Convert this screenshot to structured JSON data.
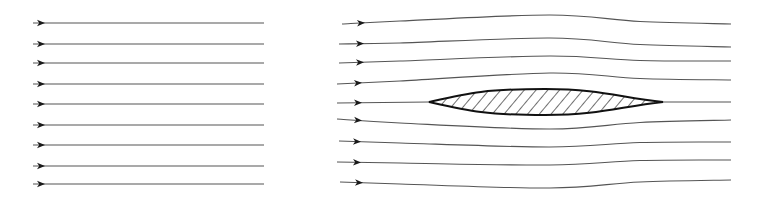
{
  "diagram": {
    "colors": {
      "background": "#ffffff",
      "streamline": "#555555",
      "arrowhead": "#1a1a1a",
      "airfoil_stroke": "#111111",
      "hatch": "#222222"
    },
    "left_panel": {
      "description": "Uniform undisturbed flow: 9 parallel horizontal streamlines",
      "arrow_x": 42,
      "x_start": 33,
      "x_end": 264,
      "streamlines_y": [
        23,
        44,
        63,
        84,
        104,
        125,
        145,
        166,
        184
      ]
    },
    "right_panel": {
      "description": "Flow around a streamlined airfoil body (hatched, symmetric lens shape); streamlines deflect around the body",
      "airfoil": {
        "leading_edge": [
          429,
          102
        ],
        "trailing_edge": [
          663,
          102
        ],
        "top_max_y": 89,
        "bottom_max_y": 115,
        "max_thickness_x": 545,
        "hatch": "diagonal",
        "hatch_spacing": 9
      },
      "streamlines": [
        {
          "start": [
            342,
            24
          ],
          "arrow_x": 362,
          "mid": [
            [
              400,
              21
            ],
            [
              550,
              15
            ]
          ],
          "end": [
            731,
            24
          ]
        },
        {
          "start": [
            339,
            44
          ],
          "arrow_x": 361,
          "mid": [
            [
              400,
              43
            ],
            [
              550,
              38
            ]
          ],
          "end": [
            731,
            47
          ]
        },
        {
          "start": [
            339,
            63
          ],
          "arrow_x": 361,
          "mid": [
            [
              400,
              61
            ],
            [
              550,
              56
            ]
          ],
          "end": [
            731,
            61
          ]
        },
        {
          "start": [
            337,
            84
          ],
          "arrow_x": 359,
          "mid": [
            [
              400,
              81
            ],
            [
              550,
              73
            ]
          ],
          "end": [
            731,
            80
          ]
        },
        {
          "start": [
            337,
            103
          ],
          "arrow_x": 359,
          "mid": [
            [
              429,
              102
            ],
            [
              663,
              102
            ]
          ],
          "end": [
            731,
            102
          ]
        },
        {
          "start": [
            337,
            119
          ],
          "arrow_x": 359,
          "mid": [
            [
              400,
              123
            ],
            [
              550,
              129
            ]
          ],
          "end": [
            731,
            120
          ]
        },
        {
          "start": [
            339,
            141
          ],
          "arrow_x": 358,
          "mid": [
            [
              400,
              143
            ],
            [
              550,
              147
            ]
          ],
          "end": [
            731,
            142
          ]
        },
        {
          "start": [
            337,
            162
          ],
          "arrow_x": 358,
          "mid": [
            [
              400,
              163
            ],
            [
              550,
              165
            ]
          ],
          "end": [
            731,
            160
          ]
        },
        {
          "start": [
            340,
            182
          ],
          "arrow_x": 360,
          "mid": [
            [
              400,
              184
            ],
            [
              550,
              188
            ]
          ],
          "end": [
            731,
            180
          ]
        }
      ]
    }
  }
}
